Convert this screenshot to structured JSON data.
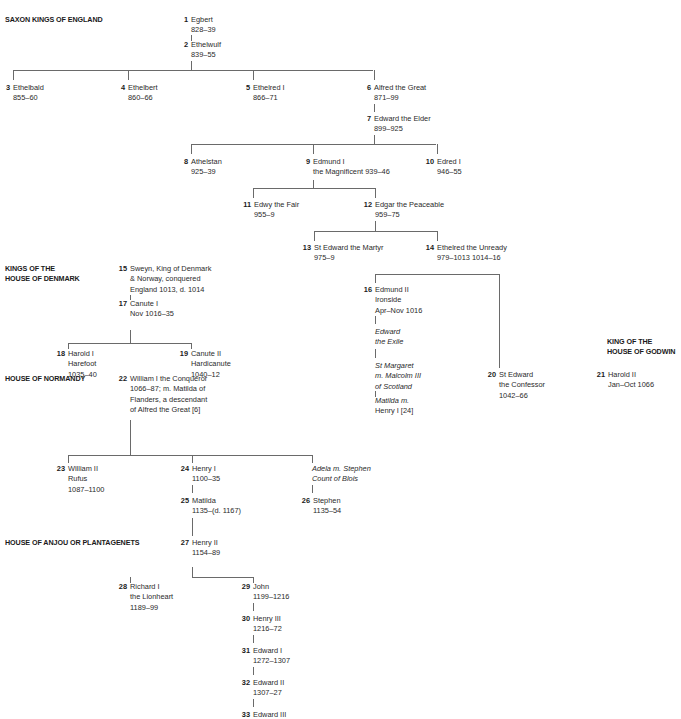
{
  "headings": [
    {
      "id": "saxon",
      "lines": [
        "SAXON KINGS OF ENGLAND"
      ],
      "x": 5,
      "y": 15
    },
    {
      "id": "denmark",
      "lines": [
        "KINGS OF THE",
        "HOUSE OF DENMARK"
      ],
      "x": 5,
      "y": 264
    },
    {
      "id": "godwin",
      "lines": [
        "KING OF THE",
        "HOUSE OF GODWIN"
      ],
      "x": 607,
      "y": 337
    },
    {
      "id": "normandy",
      "lines": [
        "HOUSE OF NORMANDY"
      ],
      "x": 5,
      "y": 374
    },
    {
      "id": "anjou",
      "lines": [
        "HOUSE OF ANJOU OR PLANTAGENETS"
      ],
      "x": 5,
      "y": 538
    }
  ],
  "nodes": [
    {
      "num": "1",
      "lines": [
        "Egbert",
        "828–39"
      ],
      "x": 191,
      "y": 15
    },
    {
      "num": "2",
      "lines": [
        "Ethelwulf",
        "839–55"
      ],
      "x": 191,
      "y": 40
    },
    {
      "num": "3",
      "lines": [
        "Ethelbald",
        "855–60"
      ],
      "x": 13,
      "y": 83
    },
    {
      "num": "4",
      "lines": [
        "Ethelbert",
        "860–66"
      ],
      "x": 128,
      "y": 83
    },
    {
      "num": "5",
      "lines": [
        "Ethelred I",
        "866–71"
      ],
      "x": 253,
      "y": 83
    },
    {
      "num": "6",
      "lines": [
        "Alfred the Great",
        "871–99"
      ],
      "x": 374,
      "y": 83
    },
    {
      "num": "7",
      "lines": [
        "Edward the Elder",
        "899–925"
      ],
      "x": 374,
      "y": 114
    },
    {
      "num": "8",
      "lines": [
        "Athelstan",
        "925–39"
      ],
      "x": 191,
      "y": 157
    },
    {
      "num": "9",
      "lines": [
        "Edmund I",
        "the Magnificent  939–46"
      ],
      "x": 313,
      "y": 157
    },
    {
      "num": "10",
      "lines": [
        "Edred I",
        "946–55"
      ],
      "x": 437,
      "y": 157
    },
    {
      "num": "11",
      "lines": [
        "Edwy the Fair",
        "955–9"
      ],
      "x": 254,
      "y": 200
    },
    {
      "num": "12",
      "lines": [
        "Edgar the Peaceable",
        "959–75"
      ],
      "x": 375,
      "y": 200
    },
    {
      "num": "13",
      "lines": [
        "St Edward the Martyr",
        "975–9"
      ],
      "x": 314,
      "y": 243
    },
    {
      "num": "14",
      "lines": [
        "Ethelred the Unready",
        "979–1013 1014–16"
      ],
      "x": 437,
      "y": 243
    },
    {
      "num": "15",
      "lines": [
        "Sweyn, King of Denmark",
        "& Norway, conquered",
        "England 1013, d. 1014"
      ],
      "x": 130,
      "y": 264
    },
    {
      "num": "16",
      "lines": [
        "Edmund II",
        "Ironside",
        "Apr–Nov 1016"
      ],
      "x": 375,
      "y": 285
    },
    {
      "num": "",
      "lines": [
        "Edward",
        "the Exile"
      ],
      "italic": true,
      "x": 375,
      "y": 327
    },
    {
      "num": "17",
      "lines": [
        "Canute I",
        "Nov 1016–35"
      ],
      "x": 130,
      "y": 299
    },
    {
      "num": "",
      "lines": [
        "St Margaret",
        "m. Malcolm III",
        "of Scotland"
      ],
      "italic": true,
      "x": 375,
      "y": 361
    },
    {
      "num": "18",
      "lines": [
        "Harold I",
        "Harefoot",
        "1035–40"
      ],
      "x": 68,
      "y": 349
    },
    {
      "num": "19",
      "lines": [
        "Canute II",
        "Hardicanute",
        "1040–12"
      ],
      "x": 191,
      "y": 349
    },
    {
      "num": "20",
      "lines": [
        "St Edward",
        "the Confessor",
        "1042–66"
      ],
      "x": 499,
      "y": 370
    },
    {
      "num": "21",
      "lines": [
        "Harold II",
        "Jan–Oct 1066"
      ],
      "x": 608,
      "y": 370
    },
    {
      "num": "",
      "lines": [
        "Matilda m."
      ],
      "italic": true,
      "x": 375,
      "y": 396
    },
    {
      "num": "",
      "lines": [
        "Henry I [24]"
      ],
      "x": 375,
      "y": 406
    },
    {
      "num": "22",
      "lines": [
        "William I the Conqueror",
        "1066–87; m. Matilda of",
        "Flanders, a descendant",
        "of Alfred the Great [6]"
      ],
      "x": 130,
      "y": 374
    },
    {
      "num": "23",
      "lines": [
        "William II",
        "Rufus",
        "1087–1100"
      ],
      "x": 68,
      "y": 464
    },
    {
      "num": "24",
      "lines": [
        "Henry I",
        "1100–35"
      ],
      "x": 192,
      "y": 464
    },
    {
      "num": "",
      "lines": [
        "Adela m. Stephen",
        "Count of Blois"
      ],
      "italic": true,
      "x": 312,
      "y": 464
    },
    {
      "num": "25",
      "lines": [
        "Matilda",
        "1135–(d. 1167)"
      ],
      "x": 192,
      "y": 496
    },
    {
      "num": "26",
      "lines": [
        "Stephen",
        "1135–54"
      ],
      "x": 313,
      "y": 496
    },
    {
      "num": "27",
      "lines": [
        "Henry II",
        "1154–89"
      ],
      "x": 192,
      "y": 538
    },
    {
      "num": "28",
      "lines": [
        "Richard I",
        "the Lionheart",
        "1189–99"
      ],
      "x": 130,
      "y": 582
    },
    {
      "num": "29",
      "lines": [
        "John",
        "1199–1216"
      ],
      "x": 253,
      "y": 582
    },
    {
      "num": "30",
      "lines": [
        "Henry III",
        "1216–72"
      ],
      "x": 253,
      "y": 614
    },
    {
      "num": "31",
      "lines": [
        "Edward I",
        "1272–1307"
      ],
      "x": 253,
      "y": 646
    },
    {
      "num": "32",
      "lines": [
        "Edward II",
        "1307–27"
      ],
      "x": 253,
      "y": 678
    },
    {
      "num": "33",
      "lines": [
        "Edward III"
      ],
      "x": 253,
      "y": 710
    }
  ],
  "connectors": {
    "h": [
      [
        13,
        70,
        360
      ],
      [
        191,
        144,
        245
      ],
      [
        253,
        188,
        122
      ],
      [
        314,
        231,
        123
      ],
      [
        375,
        274,
        124
      ],
      [
        68,
        343,
        123
      ],
      [
        68,
        455,
        244
      ],
      [
        192,
        577,
        61
      ]
    ],
    "v": [
      [
        191,
        35,
        6
      ],
      [
        191,
        61,
        9
      ],
      [
        13,
        70,
        10
      ],
      [
        128,
        70,
        10
      ],
      [
        253,
        70,
        10
      ],
      [
        374,
        70,
        10
      ],
      [
        374,
        104,
        8
      ],
      [
        374,
        135,
        9
      ],
      [
        191,
        144,
        10
      ],
      [
        313,
        144,
        10
      ],
      [
        437,
        144,
        10
      ],
      [
        313,
        180,
        8
      ],
      [
        253,
        188,
        10
      ],
      [
        375,
        188,
        10
      ],
      [
        375,
        221,
        10
      ],
      [
        314,
        231,
        10
      ],
      [
        437,
        231,
        10
      ],
      [
        375,
        274,
        9
      ],
      [
        499,
        274,
        94
      ],
      [
        375,
        316,
        8
      ],
      [
        375,
        349,
        9
      ],
      [
        375,
        391,
        6
      ],
      [
        130,
        295,
        5
      ],
      [
        130,
        330,
        13
      ],
      [
        68,
        343,
        6
      ],
      [
        191,
        343,
        6
      ],
      [
        130,
        420,
        35
      ],
      [
        68,
        455,
        8
      ],
      [
        192,
        455,
        8
      ],
      [
        312,
        455,
        8
      ],
      [
        192,
        485,
        8
      ],
      [
        312,
        485,
        8
      ],
      [
        192,
        518,
        18
      ],
      [
        192,
        567,
        10
      ],
      [
        130,
        577,
        6
      ],
      [
        253,
        577,
        6
      ],
      [
        253,
        603,
        8
      ],
      [
        253,
        635,
        8
      ],
      [
        253,
        667,
        8
      ],
      [
        253,
        699,
        8
      ]
    ]
  }
}
